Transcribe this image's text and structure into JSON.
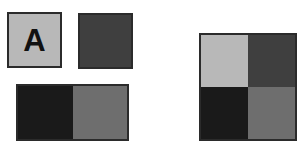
{
  "canvas": {
    "width": 305,
    "height": 154,
    "background": "#ffffff"
  },
  "palette": {
    "light_gray": "#b8b8b8",
    "medium_gray": "#6e6e6e",
    "dark_gray": "#3f3f3f",
    "near_black": "#1a1a1a",
    "border": "#2b2b2b",
    "letter_color": "#111111"
  },
  "shapes": {
    "tile_a": {
      "name": "labeled-square",
      "label": "A",
      "fill": "#b8b8b8",
      "border": "#2b2b2b"
    },
    "tile_dark": {
      "name": "solid-dark-square",
      "fill": "#3f3f3f",
      "border": "#2b2b2b"
    },
    "tile_split": {
      "name": "two-tone-rectangle",
      "left_fill": "#1a1a1a",
      "right_fill": "#6e6e6e",
      "border": "#2b2b2b"
    },
    "tile_quad": {
      "name": "four-quadrant-square",
      "border": "#2b2b2b",
      "cells": [
        {
          "position": "top-left",
          "fill": "#b8b8b8"
        },
        {
          "position": "top-right",
          "fill": "#3f3f3f"
        },
        {
          "position": "bottom-left",
          "fill": "#1a1a1a"
        },
        {
          "position": "bottom-right",
          "fill": "#6e6e6e"
        }
      ]
    }
  }
}
